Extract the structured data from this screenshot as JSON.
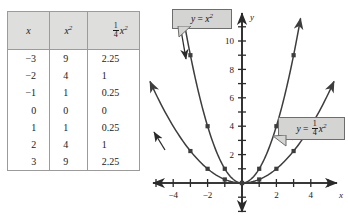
{
  "figure": {
    "type": "function-comparison-diagram"
  },
  "table": {
    "headers": [
      {
        "text": "x",
        "kind": "italic"
      },
      {
        "text": "x2",
        "kind": "power",
        "base": "x",
        "exponent": "2"
      },
      {
        "text": "(1/4)x2",
        "kind": "fraction-power",
        "numerator": "1",
        "denominator": "4",
        "base": "x",
        "exponent": "2"
      }
    ],
    "rows": [
      {
        "x": "−3",
        "x2": "9",
        "quarter_x2": "2.25"
      },
      {
        "x": "−2",
        "x2": "4",
        "quarter_x2": "1"
      },
      {
        "x": "−1",
        "x2": "1",
        "quarter_x2": "0.25"
      },
      {
        "x": "0",
        "x2": "0",
        "quarter_x2": "0"
      },
      {
        "x": "1",
        "x2": "1",
        "quarter_x2": "0.25"
      },
      {
        "x": "2",
        "x2": "4",
        "quarter_x2": "1"
      },
      {
        "x": "3",
        "x2": "9",
        "quarter_x2": "2.25"
      }
    ]
  },
  "callouts": [
    {
      "id": "y-equals-x-squared",
      "lhs": "y",
      "eq": "=",
      "base": "x",
      "exponent": "2"
    },
    {
      "id": "y-equals-quarter-x-squared",
      "lhs": "y",
      "eq": "=",
      "numerator": "1",
      "denominator": "4",
      "base": "x",
      "exponent": "2"
    }
  ],
  "chart_data": {
    "type": "line",
    "title": "",
    "xlabel": "x",
    "ylabel": "y",
    "xlim": [
      -5.6,
      5.6
    ],
    "ylim": [
      -1.8,
      11.8
    ],
    "grid": false,
    "legend": "callout-labels",
    "x_ticks": [
      -5,
      -4,
      -3,
      -2,
      -1,
      1,
      2,
      3,
      4,
      5
    ],
    "x_tick_labels": [
      {
        "value": -4,
        "label": "−4"
      },
      {
        "value": -2,
        "label": "−2"
      },
      {
        "value": 2,
        "label": "2"
      },
      {
        "value": 4,
        "label": "4"
      }
    ],
    "y_ticks": [
      1,
      2,
      3,
      4,
      5,
      6,
      7,
      8,
      9,
      10,
      11
    ],
    "y_tick_labels": [
      {
        "value": 2,
        "label": "2"
      },
      {
        "value": 4,
        "label": "4"
      },
      {
        "value": 6,
        "label": "6"
      },
      {
        "value": 8,
        "label": "8"
      },
      {
        "value": 10,
        "label": "10"
      }
    ],
    "series": [
      {
        "name": "y = x^2",
        "color": "#3d3d3d",
        "marker": "square",
        "arrows": "both-ends",
        "x": [
          -3,
          -2,
          -1,
          0,
          1,
          2,
          3
        ],
        "values": [
          9,
          4,
          1,
          0,
          1,
          4,
          9
        ]
      },
      {
        "name": "y = (1/4)x^2",
        "color": "#3d3d3d",
        "marker": "square",
        "arrows": "both-ends",
        "x": [
          -3,
          -2,
          -1,
          0,
          1,
          2,
          3
        ],
        "values": [
          2.25,
          1,
          0.25,
          0,
          0.25,
          1,
          2.25
        ]
      }
    ],
    "axis_color": "#2b2b2b",
    "curve_color": "#3d3d3d"
  }
}
